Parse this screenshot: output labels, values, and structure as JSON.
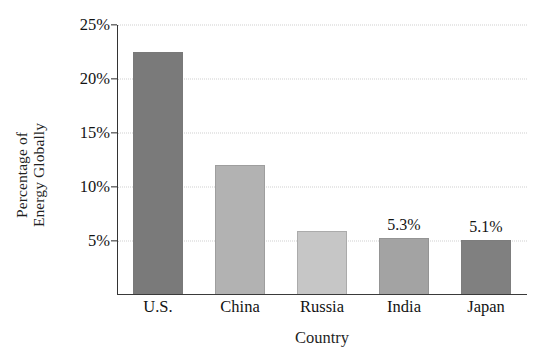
{
  "chart_data": {
    "type": "bar",
    "title": "",
    "subtitle": "",
    "xlabel": "Country",
    "ylabel": "Percentage of Energy Globally",
    "ylabel_lines": [
      "Percentage of",
      "Energy Globally"
    ],
    "categories": [
      "U.S.",
      "China",
      "Russia",
      "India",
      "Japan"
    ],
    "values": [
      22.5,
      12.0,
      5.9,
      5.3,
      5.1
    ],
    "value_labels": [
      "",
      "",
      "",
      "5.3%",
      "5.1%"
    ],
    "bar_colors": [
      "#7a7a7a",
      "#b2b2b2",
      "#c6c6c6",
      "#a3a3a3",
      "#808080"
    ],
    "ylim": [
      0,
      25
    ],
    "yticks": [
      5,
      10,
      15,
      20,
      25
    ],
    "ytick_labels": [
      "5%",
      "10%",
      "15%",
      "20%",
      "25%"
    ],
    "grid": true,
    "grid_axis": "y",
    "grid_style": "dotted",
    "grid_color": "#cfcfcf",
    "legend": false,
    "legend_position": "none",
    "axis_color": "#333333",
    "background": "#ffffff"
  }
}
